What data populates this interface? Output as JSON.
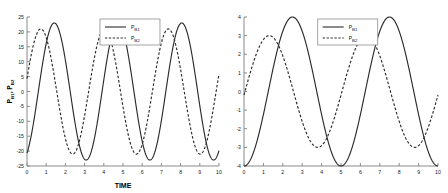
{
  "figure": {
    "background": "#ffffff",
    "curve_color": "#2b2b2b",
    "axis_color": "#8a8a8a"
  },
  "chart_data": [
    {
      "id": "left",
      "type": "line",
      "title": "",
      "xlabel": "TIME",
      "ylabel": "P_B1, P_B2",
      "ylabel_parts": {
        "base1": "P",
        "sub1": "B1",
        "sep": ", ",
        "base2": "P",
        "sub2": "B2"
      },
      "xlim": [
        0,
        10
      ],
      "ylim": [
        -25,
        25
      ],
      "xticks": [
        0,
        1,
        2,
        3,
        4,
        5,
        6,
        7,
        8,
        9,
        10
      ],
      "xticklabels": [
        "0",
        "1",
        "2",
        "3",
        "4",
        "5",
        "6",
        "7",
        "8",
        "9",
        "10"
      ],
      "yticks": [
        -25,
        -20,
        -15,
        -10,
        -5,
        0,
        5,
        10,
        15,
        20,
        25
      ],
      "yticklabels": [
        "-25",
        "-20",
        "-15",
        "-10",
        "-5",
        "0",
        "5",
        "10",
        "15",
        "20",
        "25"
      ],
      "grid": false,
      "legend_position": "upper center",
      "series": [
        {
          "name": "P_B1",
          "label_base": "P",
          "label_sub": "B1",
          "style": "solid",
          "amplitude": 23.0,
          "period": 3.32,
          "phase_peak_t": 1.42,
          "start_value": -20.0,
          "peaks_t": [
            1.42,
            4.74,
            8.06
          ],
          "peaks_y": [
            23.0,
            23.0,
            23.0
          ],
          "troughs_t": [
            3.0,
            6.35,
            9.7
          ],
          "troughs_y": [
            -23.5,
            -23.5,
            -23.5
          ]
        },
        {
          "name": "P_B2",
          "label_base": "P",
          "label_sub": "B2",
          "style": "dashed",
          "amplitude": 21.0,
          "period": 3.32,
          "phase_peak_t": 0.72,
          "start_value": 13.0,
          "peaks_t": [
            0.72,
            4.05,
            7.35
          ],
          "peaks_y": [
            21.0,
            21.0,
            21.0
          ],
          "troughs_t": [
            2.3,
            5.7,
            9.0
          ],
          "troughs_y": [
            -21.0,
            -21.0,
            -21.0
          ]
        }
      ]
    },
    {
      "id": "right",
      "type": "line",
      "title": "",
      "xlabel": "",
      "ylabel": "",
      "xlim": [
        0,
        10
      ],
      "ylim": [
        -4,
        4
      ],
      "xticks": [
        0,
        1,
        2,
        3,
        4,
        5,
        6,
        7,
        8,
        9,
        10
      ],
      "xticklabels": [
        "0",
        "1",
        "2",
        "3",
        "4",
        "5",
        "6",
        "7",
        "8",
        "9",
        "10"
      ],
      "yticks": [
        -4,
        -3,
        -2,
        -1,
        0,
        1,
        2,
        3,
        4
      ],
      "yticklabels": [
        "-4",
        "-3",
        "-2",
        "-1",
        "0",
        "1",
        "2",
        "3",
        "4"
      ],
      "grid": false,
      "legend_position": "upper center",
      "series": [
        {
          "name": "P_B1",
          "label_base": "P",
          "label_sub": "B1",
          "style": "solid",
          "amplitude": 4.0,
          "period": 5.0,
          "phase_peak_t": 2.5,
          "start_value": -4.0,
          "peaks_t": [
            2.5,
            7.5
          ],
          "peaks_y": [
            4.0,
            4.0
          ],
          "troughs_t": [
            0.0,
            5.0,
            10.0
          ],
          "troughs_y": [
            -4.0,
            -4.0,
            -4.0
          ]
        },
        {
          "name": "P_B2",
          "label_base": "P",
          "label_sub": "B2",
          "style": "dashed",
          "amplitude": 3.0,
          "period": 5.0,
          "phase_peak_t": 1.3,
          "start_value": 0.6,
          "peaks_t": [
            1.3,
            6.3
          ],
          "peaks_y": [
            3.0,
            3.0
          ],
          "troughs_t": [
            3.85,
            8.85
          ],
          "troughs_y": [
            -3.0,
            -3.0
          ]
        }
      ]
    }
  ]
}
